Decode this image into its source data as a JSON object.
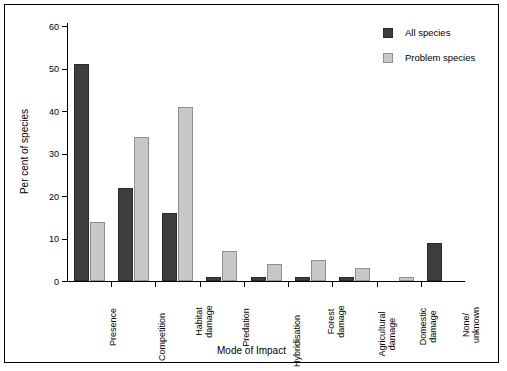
{
  "chart_data": {
    "type": "bar",
    "title": "",
    "xlabel": "Mode of Impact",
    "ylabel": "Per cent of species",
    "ylim": [
      0,
      60
    ],
    "yticks": [
      0,
      10,
      20,
      30,
      40,
      50,
      60
    ],
    "grid": false,
    "legend_position": "top-right",
    "categories": [
      "Presence",
      "Competition",
      "Habitat\ndamage",
      "Predation",
      "Hybridisation",
      "Forest\ndamage",
      "Agricultural\ndamage",
      "Domestic\ndamage",
      "None/\nunknown"
    ],
    "series": [
      {
        "name": "All species",
        "color": "#3d3d3d",
        "values": [
          51,
          22,
          16,
          1,
          1,
          1,
          1,
          0,
          9
        ]
      },
      {
        "name": "Problem species",
        "color": "#c8c8c8",
        "values": [
          14,
          34,
          41,
          7,
          4,
          5,
          3,
          1,
          0
        ]
      }
    ]
  },
  "legend": {
    "items": [
      {
        "label": "All species",
        "swatch": "all"
      },
      {
        "label": "Problem species",
        "swatch": "problem"
      }
    ]
  }
}
